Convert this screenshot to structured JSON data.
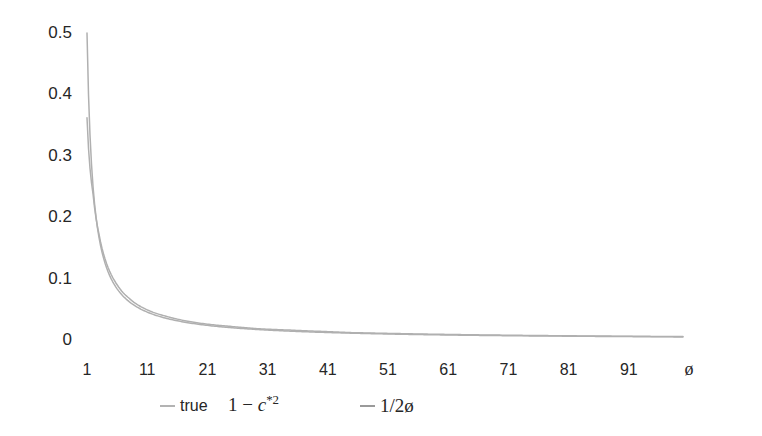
{
  "chart_data": {
    "type": "line",
    "title": "",
    "xlabel": "ø",
    "ylabel": "",
    "grid": false,
    "legend_position": "bottom",
    "xlim": [
      1,
      101
    ],
    "ylim": [
      0,
      0.5
    ],
    "x_tick_labels": [
      "1",
      "11",
      "21",
      "31",
      "41",
      "51",
      "61",
      "71",
      "81",
      "91"
    ],
    "x_tick_values": [
      1,
      11,
      21,
      31,
      41,
      51,
      61,
      71,
      81,
      91
    ],
    "y_tick_labels": [
      "0",
      "0.1",
      "0.2",
      "0.3",
      "0.4",
      "0.5"
    ],
    "y_tick_values": [
      0,
      0.1,
      0.2,
      0.3,
      0.4,
      0.5
    ],
    "series": [
      {
        "name": "true",
        "legend_label": "true",
        "color": "#b0b0b0",
        "x": [
          1,
          2,
          3,
          4,
          5,
          6,
          7,
          8,
          9,
          10,
          12,
          14,
          16,
          18,
          20,
          25,
          30,
          35,
          40,
          45,
          50,
          60,
          70,
          80,
          90,
          100
        ],
        "values": [
          0.362,
          0.238,
          0.172,
          0.132,
          0.107,
          0.09,
          0.077,
          0.068,
          0.06,
          0.054,
          0.045,
          0.039,
          0.034,
          0.03,
          0.027,
          0.022,
          0.018,
          0.016,
          0.014,
          0.012,
          0.011,
          0.0092,
          0.0079,
          0.0069,
          0.0062,
          0.0056
        ]
      },
      {
        "name": "1-c*2",
        "legend_label_parts": {
          "lead": "1 − ",
          "italic": "c",
          "sup": "*2"
        },
        "color": "#b0b0b0",
        "x": [],
        "values": []
      },
      {
        "name": "1/2ø",
        "legend_label": "1/2ø",
        "color": "#b0b0b0",
        "x": [
          1,
          2,
          3,
          4,
          5,
          6,
          7,
          8,
          9,
          10,
          12,
          14,
          16,
          18,
          20,
          25,
          30,
          35,
          40,
          45,
          50,
          60,
          70,
          80,
          90,
          100
        ],
        "values": [
          0.5,
          0.25,
          0.1667,
          0.125,
          0.1,
          0.0833,
          0.0714,
          0.0625,
          0.0556,
          0.05,
          0.0417,
          0.0357,
          0.0313,
          0.0278,
          0.025,
          0.02,
          0.0167,
          0.0143,
          0.0125,
          0.0111,
          0.01,
          0.0083,
          0.0071,
          0.0063,
          0.0056,
          0.005
        ]
      }
    ]
  },
  "legend": {
    "entries": [
      {
        "label": "true",
        "kind": "sans"
      },
      {
        "label": "1 − c*2",
        "kind": "serif-math"
      },
      {
        "label": "1/2ø",
        "kind": "serif"
      }
    ]
  }
}
